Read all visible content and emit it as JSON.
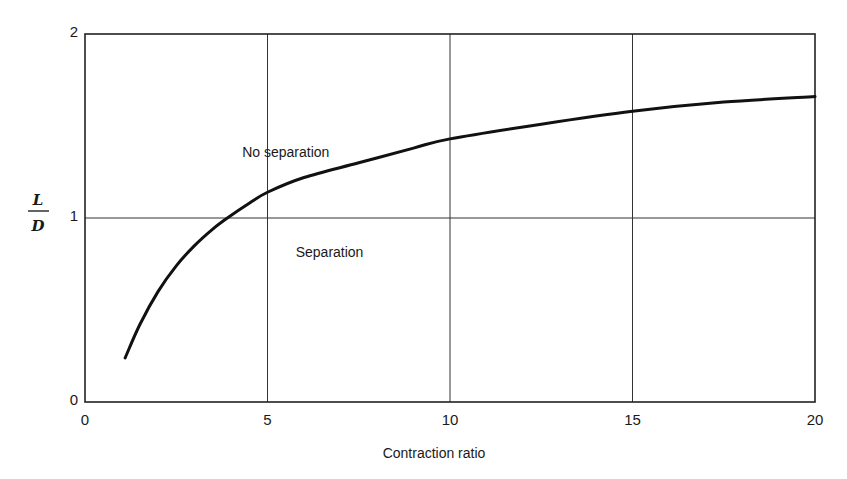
{
  "chart_data": {
    "type": "line",
    "title": "",
    "xlabel": "Contraction ratio",
    "ylabel": "L/D",
    "ylabel_numerator": "L",
    "ylabel_denominator": "D",
    "xlim": [
      0,
      20
    ],
    "ylim": [
      0,
      2
    ],
    "xticks": [
      0,
      5,
      10,
      15,
      20
    ],
    "yticks": [
      0,
      1,
      2
    ],
    "xtick_labels": [
      "0",
      "5",
      "10",
      "15",
      "20"
    ],
    "ytick_labels": [
      "0",
      "1",
      "2"
    ],
    "grid": {
      "x": [
        5,
        10,
        15
      ],
      "y": [
        1
      ]
    },
    "legend": null,
    "series": [
      {
        "name": "Separation boundary",
        "x": [
          1.1,
          1.5,
          2.0,
          2.5,
          3.0,
          3.5,
          3.9,
          4.5,
          5.0,
          6.0,
          7.5,
          9.0,
          10.0,
          12.5,
          15.0,
          17.5,
          20.0
        ],
        "y": [
          0.24,
          0.42,
          0.6,
          0.74,
          0.85,
          0.94,
          1.0,
          1.08,
          1.14,
          1.22,
          1.3,
          1.38,
          1.43,
          1.51,
          1.58,
          1.63,
          1.66
        ]
      }
    ],
    "annotations": [
      {
        "text": "No separation",
        "x": 5.5,
        "y": 1.33
      },
      {
        "text": "Separation",
        "x": 6.7,
        "y": 0.79
      }
    ]
  }
}
